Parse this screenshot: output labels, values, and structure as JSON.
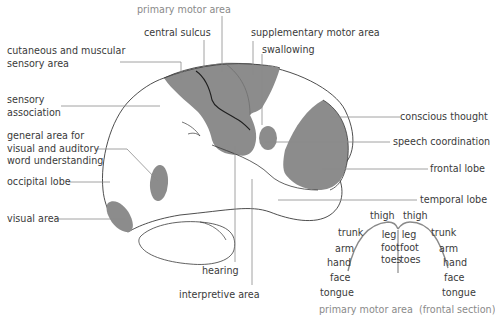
{
  "colors": {
    "region_fill": "#8c8c8c",
    "outline": "#3a3a3a",
    "leader_line": "#8a8a8a",
    "text": "#3a3a3a",
    "caption_text": "#8a8a8a",
    "background": "#ffffff"
  },
  "brain_labels": {
    "primary_motor_area": "primary motor area",
    "central_sulcus": "central sulcus",
    "supplementary_motor_area": "supplementary motor area",
    "swallowing": "swallowing",
    "cutaneous_line1": "cutaneous and muscular",
    "cutaneous_line2": "sensory area",
    "sensory_assoc_line1": "sensory",
    "sensory_assoc_line2": "association",
    "general_area_line1": "general area for",
    "general_area_line2": "visual and auditory",
    "general_area_line3": "word understanding",
    "occipital_lobe": "occipital lobe",
    "visual_area": "visual area",
    "conscious_thought": "conscious thought",
    "speech_coordination": "speech coordination",
    "frontal_lobe": "frontal lobe",
    "temporal_lobe": "temporal lobe",
    "hearing": "hearing",
    "interpretive_area": "interpretive area"
  },
  "frontal_section": {
    "left": [
      "thigh",
      "trunk",
      "arm",
      "hand",
      "face",
      "tongue"
    ],
    "right": [
      "thigh",
      "trunk",
      "arm",
      "hand",
      "face",
      "tongue"
    ],
    "inner_left": [
      "leg",
      "foot",
      "toes"
    ],
    "inner_right": [
      "leg",
      "foot",
      "toes"
    ],
    "caption_main": "primary motor area",
    "caption_sub": "(frontal section)"
  }
}
